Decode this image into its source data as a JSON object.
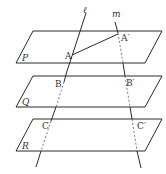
{
  "diagram": {
    "type": "three-parallel-planes-cut-by-two-lines",
    "planes": [
      {
        "name": "P",
        "label": "P"
      },
      {
        "name": "Q",
        "label": "Q"
      },
      {
        "name": "R",
        "label": "R"
      }
    ],
    "lines": [
      {
        "name": "l",
        "label": "ℓ"
      },
      {
        "name": "m",
        "label": "m"
      }
    ],
    "points": [
      {
        "name": "A",
        "label": "A"
      },
      {
        "name": "A_prime",
        "label": "A′"
      },
      {
        "name": "B",
        "label": "B"
      },
      {
        "name": "B_prime",
        "label": "B′"
      },
      {
        "name": "C",
        "label": "C"
      },
      {
        "name": "C_prime",
        "label": "C′"
      }
    ],
    "segments": [
      {
        "from": "A",
        "to": "A_prime"
      }
    ]
  }
}
